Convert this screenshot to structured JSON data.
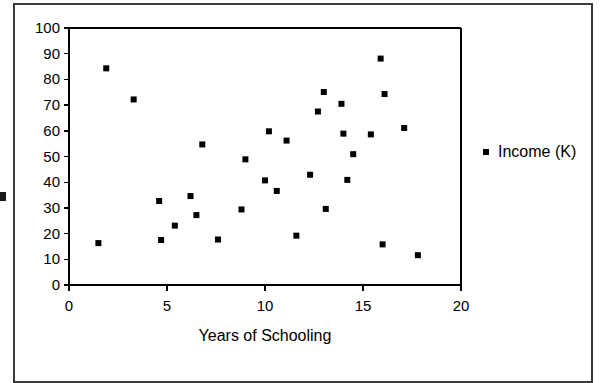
{
  "chart_data": {
    "type": "scatter",
    "title": "",
    "xlabel": "Years of Schooling",
    "ylabel": "",
    "xlim": [
      0,
      20
    ],
    "ylim": [
      0,
      100
    ],
    "xticks": [
      0,
      5,
      10,
      15,
      20
    ],
    "yticks": [
      0,
      10,
      20,
      30,
      40,
      50,
      60,
      70,
      80,
      90,
      100
    ],
    "grid": false,
    "legend_position": "right",
    "series": [
      {
        "name": "Income (K)",
        "marker": "square",
        "color": "#000000",
        "points": [
          [
            1.5,
            16.3
          ],
          [
            1.9,
            84.3
          ],
          [
            3.3,
            72.2
          ],
          [
            4.6,
            32.7
          ],
          [
            4.7,
            17.5
          ],
          [
            5.4,
            23.1
          ],
          [
            6.2,
            34.6
          ],
          [
            6.5,
            27.2
          ],
          [
            6.8,
            54.7
          ],
          [
            7.6,
            17.7
          ],
          [
            8.8,
            29.4
          ],
          [
            9.0,
            48.9
          ],
          [
            10.0,
            40.7
          ],
          [
            10.2,
            59.8
          ],
          [
            10.6,
            36.6
          ],
          [
            11.1,
            56.2
          ],
          [
            11.6,
            19.2
          ],
          [
            12.3,
            42.9
          ],
          [
            12.7,
            67.5
          ],
          [
            13.0,
            75.1
          ],
          [
            13.1,
            29.6
          ],
          [
            13.9,
            70.5
          ],
          [
            14.0,
            58.9
          ],
          [
            14.2,
            40.9
          ],
          [
            14.5,
            50.9
          ],
          [
            15.4,
            58.6
          ],
          [
            15.9,
            88.1
          ],
          [
            16.0,
            15.8
          ],
          [
            16.1,
            74.3
          ],
          [
            17.1,
            61.1
          ],
          [
            17.8,
            11.6
          ]
        ]
      }
    ]
  },
  "legend": {
    "label": "Income (K)",
    "marker_color": "#000000"
  },
  "axes": {
    "x_title": "Years of Schooling",
    "x_tick_labels": [
      "0",
      "5",
      "10",
      "15",
      "20"
    ],
    "y_tick_labels": [
      "0",
      "10",
      "20",
      "30",
      "40",
      "50",
      "60",
      "70",
      "80",
      "90",
      "100"
    ]
  },
  "style": {
    "axis_color": "#000000",
    "marker_color": "#000000",
    "background": "#ffffff",
    "frame_color": "#3a3a3a"
  }
}
